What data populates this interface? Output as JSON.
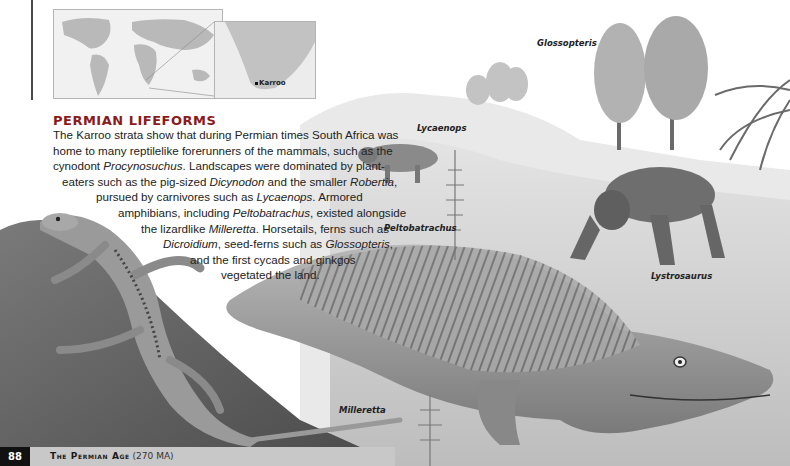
{
  "page": {
    "number": "88",
    "running_title": "The Permian Age",
    "running_title_suffix": "(270 MA)"
  },
  "map": {
    "inset_label": "Karroo"
  },
  "article": {
    "heading": "PERMIAN LIFEFORMS",
    "lines": [
      [
        "The Karroo strata show that during Permian times South Africa was",
        "",
        ""
      ],
      [
        "home to many reptilelike forerunners of the mammals, such as the",
        "",
        ""
      ],
      [
        "cynodont ",
        "Procynosuchus",
        ". Landscapes were dominated by plant-"
      ],
      [
        "eaters such as the pig-sized ",
        "Dicynodon",
        " and the smaller "
      ],
      [
        "pursued by carnivores such as ",
        "Lycaenops",
        ". Armored"
      ],
      [
        "amphibians, including ",
        "Peltobatrachus",
        ", existed alongside"
      ],
      [
        "the lizardlike ",
        "Milleretta",
        ". Horsetails, ferns such as"
      ],
      [
        "",
        "Dicroidium",
        ", seed-ferns such as "
      ],
      [
        "and the first cycads and ginkgos",
        "",
        ""
      ],
      [
        "vegetated the land.",
        "",
        ""
      ]
    ],
    "line4_extra_italic": "Robertia",
    "line4_extra_tail": ",",
    "line8_extra_italic": "Glossopteris",
    "line8_extra_tail": ","
  },
  "illustration_labels": {
    "glossopteris": "Glossopteris",
    "lycaenops": "Lycaenops",
    "peltobatrachus": "Peltobatrachus",
    "lystrosaurus": "Lystrosaurus",
    "milleretta": "Milleretta"
  },
  "colors": {
    "heading": "#8b1b1b",
    "footer_bar": "#c8c8c8",
    "page_number_bg": "#111111"
  }
}
